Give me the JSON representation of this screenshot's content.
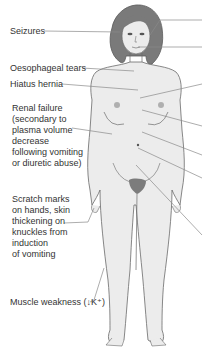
{
  "diagram": {
    "colors": {
      "skin": "#ececec",
      "outline": "#6a6a6a",
      "hair": "#7a7a7a",
      "hair_dark": "#5c5c5c",
      "pubic": "#7c7c7c",
      "nipple": "#a9a9a9",
      "leader_line": "#8a8a8a",
      "text": "#333333"
    },
    "left_labels": [
      {
        "id": "seizures",
        "text": "Seizures"
      },
      {
        "id": "oesophageal-tears",
        "text": "Oesophageal tears"
      },
      {
        "id": "hiatus-hernia",
        "text": "Hiatus hernia"
      },
      {
        "id": "renal-failure",
        "lines": [
          "Renal failure",
          "(secondary to",
          "plasma volume",
          "decrease",
          "following vomiting",
          "or diuretic abuse)"
        ]
      },
      {
        "id": "scratch-marks",
        "lines": [
          "Scratch marks",
          "on hands, skin",
          "thickening on",
          "knuckles from",
          "induction",
          "of vomiting"
        ]
      },
      {
        "id": "muscle-weakness",
        "text": "Muscle weakness (↓K⁺)"
      }
    ],
    "right_leader_lines": 8
  }
}
